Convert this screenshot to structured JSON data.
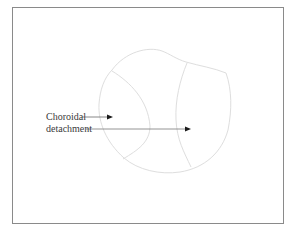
{
  "figure": {
    "type": "ocular-diagram",
    "annotation": {
      "line1": "Choroidal",
      "line2": "detachment"
    },
    "colors": {
      "frame_border": "#8a8a8a",
      "outline": "#dedede",
      "arrow": "#5a5a5a",
      "text": "#3a3a3a"
    }
  }
}
